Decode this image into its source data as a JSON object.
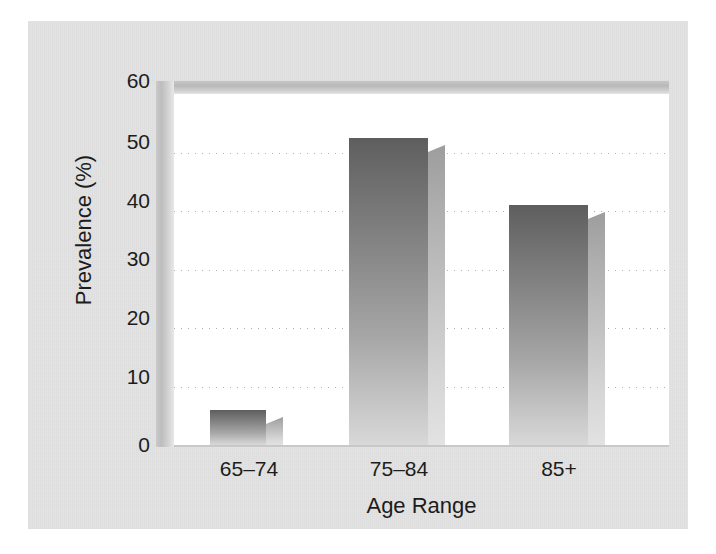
{
  "figure": {
    "background_color": "#ffffff",
    "panel_color": "#e3e3e3",
    "plot_background_color": "#ffffff",
    "frame_color": "#bdbdbd"
  },
  "chart_data": {
    "type": "bar",
    "title": "",
    "subtitle": "",
    "xlabel": "Age Range",
    "ylabel": "Prevalence (%)",
    "categories": [
      "65–74",
      "75–84",
      "85+"
    ],
    "values": [
      6,
      52.5,
      41
    ],
    "series": [
      {
        "name": "Prevalence",
        "values": [
          6,
          52.5,
          41
        ]
      }
    ],
    "ylim": [
      0,
      60
    ],
    "yticks": [
      0,
      10,
      20,
      30,
      40,
      50,
      60
    ],
    "ytick_labels": [
      "0",
      "10",
      "20",
      "30",
      "40",
      "50",
      "60"
    ],
    "xtick_labels": [
      "65–74",
      "75–84",
      "85+"
    ],
    "grid": true,
    "grid_axis": "y",
    "grid_style": "dotted",
    "legend": false,
    "legend_position": "none",
    "annotations": [],
    "bar_style": "3d-shaded-gradient",
    "bar_gradient_top_color": "#5e5e5e",
    "bar_gradient_bottom_color": "#d8d8d8",
    "bar_side_color": "#c2c2c2"
  },
  "axes": {
    "y_ticks": [
      {
        "value": 60,
        "label": "60"
      },
      {
        "value": 50,
        "label": "50"
      },
      {
        "value": 40,
        "label": "40"
      },
      {
        "value": 30,
        "label": "30"
      },
      {
        "value": 20,
        "label": "20"
      },
      {
        "value": 10,
        "label": "10"
      },
      {
        "value": 0,
        "label": "0"
      }
    ],
    "x_ticks": [
      {
        "label": "65–74"
      },
      {
        "label": "75–84"
      },
      {
        "label": "85+"
      }
    ],
    "y_axis_title": "Prevalence (%)",
    "x_axis_title": "Age Range"
  },
  "bars": [
    {
      "category": "65–74",
      "value": 6
    },
    {
      "category": "75–84",
      "value": 52.5
    },
    {
      "category": "85+",
      "value": 41
    }
  ]
}
